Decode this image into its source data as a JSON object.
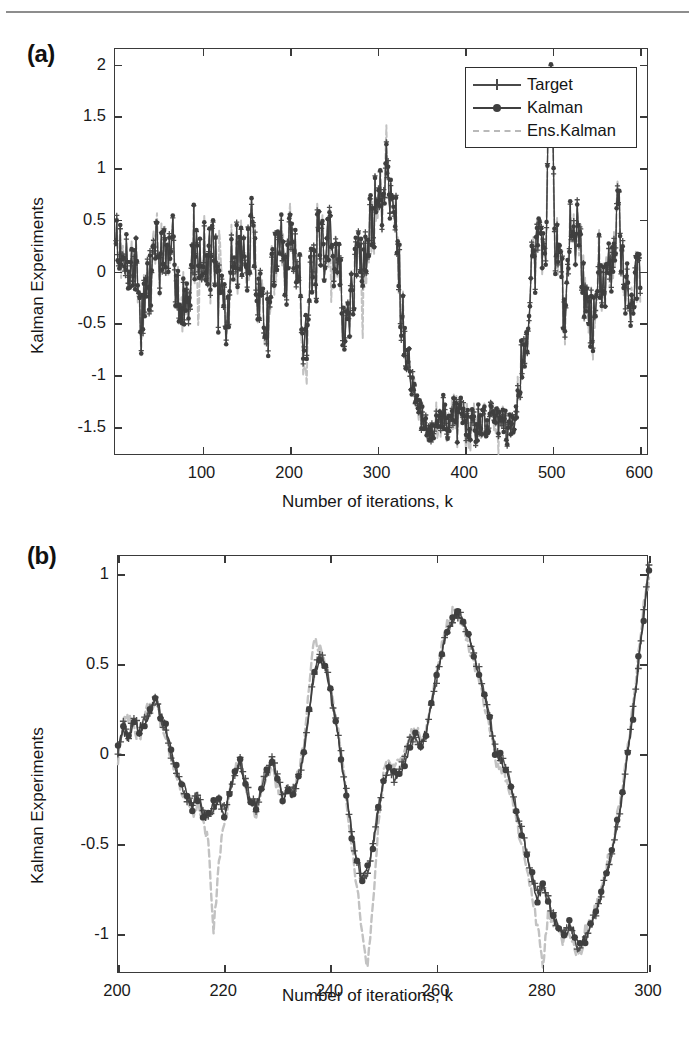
{
  "figure": {
    "panels": [
      {
        "id": "a",
        "letter": "(a)",
        "ylabel": "Kalman Experiments",
        "xlabel": "Number of iterations, k"
      },
      {
        "id": "b",
        "letter": "(b)",
        "ylabel": "Kalman Experiments",
        "xlabel": "Number of iterations, k"
      }
    ],
    "legend": {
      "items": [
        {
          "label": "Target",
          "marker": "plus",
          "style": "solid",
          "color": "#4a4a4a"
        },
        {
          "label": "Kalman",
          "marker": "dot",
          "style": "solid",
          "color": "#3f3f3f"
        },
        {
          "label": "Ens.Kalman",
          "marker": "none",
          "style": "dashed",
          "color": "#bdbdbd"
        }
      ]
    }
  },
  "chart_data": [
    {
      "type": "line",
      "panel": "a",
      "title": "(a)",
      "xlabel": "Number of iterations, k",
      "ylabel": "Kalman Experiments",
      "xlim": [
        0,
        610
      ],
      "ylim": [
        -1.78,
        2.15
      ],
      "xticks": [
        100,
        200,
        300,
        400,
        500,
        600
      ],
      "yticks": [
        -1.5,
        -1,
        -0.5,
        0,
        0.5,
        1,
        1.5,
        2
      ],
      "grid": false,
      "legend_position": "top-right",
      "series": [
        {
          "name": "Target",
          "color": "#4a4a4a",
          "style": "solid",
          "marker": "plus"
        },
        {
          "name": "Kalman",
          "color": "#3f3f3f",
          "style": "solid",
          "marker": "dot"
        },
        {
          "name": "Ens.Kalman",
          "color": "#bdbdbd",
          "style": "dashed",
          "marker": "none"
        }
      ],
      "envelope_notes": {
        "noise_band_1_to_300": [
          -0.8,
          1.05
        ],
        "major_peak_near_310": 1.45,
        "sustained_trough_330_to_470": -1.55,
        "sharp_rise_near_485_to_505": 2.1,
        "noise_band_505_to_600": [
          -0.95,
          0.95
        ]
      }
    },
    {
      "type": "line",
      "panel": "b",
      "title": "(b)",
      "xlabel": "Number of iterations, k",
      "ylabel": "Kalman Experiments",
      "xlim": [
        200,
        300
      ],
      "ylim": [
        -1.22,
        1.1
      ],
      "xticks": [
        200,
        220,
        240,
        260,
        280,
        300
      ],
      "yticks": [
        -1,
        -0.5,
        0,
        0.5,
        1
      ],
      "grid": false,
      "legend_position": "top-right",
      "series": [
        {
          "name": "Target",
          "color": "#4a4a4a",
          "style": "solid",
          "marker": "plus"
        },
        {
          "name": "Kalman",
          "color": "#3f3f3f",
          "style": "solid",
          "marker": "dot"
        },
        {
          "name": "Ens.Kalman",
          "color": "#bdbdbd",
          "style": "dashed",
          "marker": "none"
        }
      ],
      "x": [
        200,
        201,
        202,
        203,
        204,
        205,
        206,
        207,
        208,
        209,
        210,
        211,
        212,
        213,
        214,
        215,
        216,
        217,
        218,
        219,
        220,
        221,
        222,
        223,
        224,
        225,
        226,
        227,
        228,
        229,
        230,
        231,
        232,
        233,
        234,
        235,
        236,
        237,
        238,
        239,
        240,
        241,
        242,
        243,
        244,
        245,
        246,
        247,
        248,
        249,
        250,
        251,
        252,
        253,
        254,
        255,
        256,
        257,
        258,
        259,
        260,
        261,
        262,
        263,
        264,
        265,
        266,
        267,
        268,
        269,
        270,
        271,
        272,
        273,
        274,
        275,
        276,
        277,
        278,
        279,
        280,
        281,
        282,
        283,
        284,
        285,
        286,
        287,
        288,
        289,
        290,
        291,
        292,
        293,
        294,
        295,
        296,
        297,
        298,
        299,
        300
      ],
      "target": [
        0.02,
        0.17,
        0.1,
        0.2,
        0.12,
        0.19,
        0.24,
        0.32,
        0.2,
        0.12,
        0.0,
        -0.1,
        -0.18,
        -0.24,
        -0.29,
        -0.22,
        -0.32,
        -0.35,
        -0.3,
        -0.26,
        -0.31,
        -0.22,
        -0.1,
        -0.03,
        -0.16,
        -0.25,
        -0.3,
        -0.2,
        -0.09,
        -0.02,
        -0.13,
        -0.23,
        -0.17,
        -0.21,
        -0.13,
        0.0,
        0.24,
        0.46,
        0.55,
        0.5,
        0.36,
        0.18,
        0.0,
        -0.2,
        -0.42,
        -0.6,
        -0.7,
        -0.66,
        -0.52,
        -0.3,
        -0.14,
        -0.08,
        -0.13,
        -0.1,
        -0.02,
        0.08,
        0.11,
        0.05,
        0.1,
        0.26,
        0.42,
        0.56,
        0.68,
        0.75,
        0.78,
        0.74,
        0.66,
        0.56,
        0.46,
        0.34,
        0.2,
        0.04,
        -0.04,
        -0.06,
        -0.17,
        -0.3,
        -0.42,
        -0.56,
        -0.7,
        -0.78,
        -0.72,
        -0.8,
        -0.9,
        -0.96,
        -1.0,
        -0.96,
        -1.02,
        -1.09,
        -1.0,
        -0.96,
        -0.88,
        -0.78,
        -0.66,
        -0.54,
        -0.4,
        -0.22,
        0.0,
        0.24,
        0.5,
        0.78,
        1.05
      ],
      "kalman": [
        0.04,
        0.14,
        0.08,
        0.18,
        0.14,
        0.17,
        0.22,
        0.33,
        0.22,
        0.14,
        0.02,
        -0.08,
        -0.16,
        -0.22,
        -0.3,
        -0.24,
        -0.34,
        -0.33,
        -0.28,
        -0.27,
        -0.34,
        -0.2,
        -0.12,
        -0.05,
        -0.18,
        -0.27,
        -0.28,
        -0.22,
        -0.11,
        -0.04,
        -0.15,
        -0.25,
        -0.19,
        -0.23,
        -0.15,
        0.02,
        0.26,
        0.47,
        0.53,
        0.48,
        0.34,
        0.16,
        -0.02,
        -0.22,
        -0.44,
        -0.58,
        -0.68,
        -0.64,
        -0.5,
        -0.32,
        -0.16,
        -0.06,
        -0.11,
        -0.12,
        -0.04,
        0.06,
        0.13,
        0.07,
        0.12,
        0.28,
        0.44,
        0.58,
        0.7,
        0.76,
        0.79,
        0.72,
        0.64,
        0.54,
        0.44,
        0.32,
        0.18,
        0.02,
        -0.02,
        -0.08,
        -0.19,
        -0.32,
        -0.44,
        -0.54,
        -0.68,
        -0.8,
        -0.74,
        -0.82,
        -0.92,
        -0.94,
        -1.02,
        -0.94,
        -1.0,
        -1.06,
        -1.02,
        -0.94,
        -0.9,
        -0.76,
        -0.68,
        -0.52,
        -0.38,
        -0.24,
        0.02,
        0.22,
        0.52,
        0.76,
        1.02
      ],
      "ens_kalman": [
        -0.02,
        0.16,
        0.2,
        0.14,
        0.08,
        0.22,
        0.27,
        0.3,
        0.18,
        0.1,
        -0.02,
        -0.12,
        -0.2,
        -0.26,
        -0.33,
        -0.28,
        -0.36,
        -0.5,
        -0.99,
        -0.6,
        -0.38,
        -0.24,
        -0.08,
        -0.02,
        -0.2,
        -0.29,
        -0.33,
        -0.18,
        -0.12,
        -0.06,
        -0.18,
        -0.26,
        -0.22,
        -0.19,
        -0.1,
        0.06,
        0.4,
        0.62,
        0.6,
        0.52,
        0.38,
        0.2,
        0.02,
        -0.24,
        -0.5,
        -0.75,
        -1.0,
        -1.18,
        -0.84,
        -0.4,
        -0.12,
        -0.04,
        -0.08,
        -0.06,
        0.0,
        0.1,
        0.14,
        0.08,
        0.14,
        0.3,
        0.46,
        0.6,
        0.72,
        0.78,
        0.77,
        0.7,
        0.6,
        0.5,
        0.4,
        0.28,
        0.14,
        -0.02,
        -0.1,
        -0.12,
        -0.22,
        -0.36,
        -0.5,
        -0.64,
        -0.8,
        -0.95,
        -1.18,
        -0.88,
        -0.92,
        -0.98,
        -1.05,
        -0.98,
        -1.08,
        -1.12,
        -0.98,
        -0.92,
        -0.86,
        -0.74,
        -0.62,
        -0.5,
        -0.34,
        -0.18,
        0.04,
        0.28,
        0.54,
        0.82,
        0.98
      ]
    }
  ]
}
